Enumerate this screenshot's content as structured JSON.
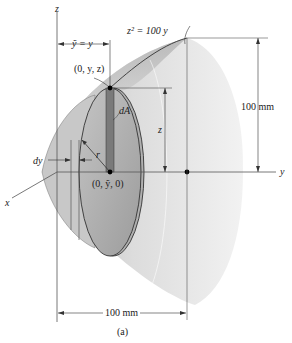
{
  "figure": {
    "caption": "(a)",
    "axes": {
      "z": "z",
      "y": "y",
      "x": "x"
    },
    "equation": "z² = 100 y",
    "centroid_label": "ỹ = y",
    "point_top": "(0, y, z)",
    "point_center": "(0, ỹ, 0)",
    "element_label": "dA",
    "radius_label": "r",
    "thickness_label": "dy",
    "height_dim_label": "z",
    "height_total": "100 mm",
    "length_total": "100 mm"
  }
}
